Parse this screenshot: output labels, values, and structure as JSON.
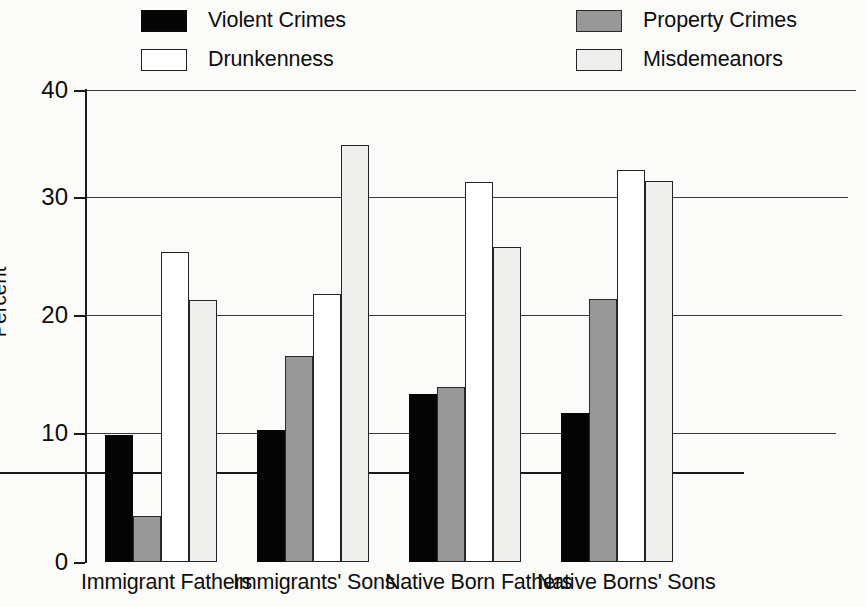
{
  "chart_data": {
    "type": "bar",
    "title": "",
    "subtitle": "",
    "xlabel": "",
    "ylabel": "Percent",
    "ylim": [
      0,
      40
    ],
    "yticks": [
      "0",
      "10",
      "20",
      "30",
      "40"
    ],
    "grid": true,
    "legend_position": "top",
    "categories": [
      "Immigrant Fathers",
      "Immigrants' Sons",
      "Native Born Fathers",
      "Native Borns' Sons"
    ],
    "series": [
      {
        "name": "Violent Crimes",
        "color": "#050505",
        "values": [
          10.8,
          11.2,
          14.2,
          12.6
        ]
      },
      {
        "name": "Property Crimes",
        "color": "#989898",
        "values": [
          3.9,
          17.5,
          14.8,
          22.3
        ]
      },
      {
        "name": "Drunkenness",
        "color": "#ffffff",
        "values": [
          26.3,
          22.7,
          32.2,
          33.2
        ]
      },
      {
        "name": "Misdemeanors",
        "color": "#efefed",
        "values": [
          22.2,
          35.3,
          26.7,
          32.3
        ]
      }
    ]
  },
  "legend": {
    "items": [
      {
        "label": "Violent Crimes",
        "swatch": "legend-swatch-violent-crimes"
      },
      {
        "label": "Property Crimes",
        "swatch": "legend-swatch-property-crimes"
      },
      {
        "label": "Drunkenness",
        "swatch": "legend-swatch-drunkenness"
      },
      {
        "label": "Misdemeanors",
        "swatch": "legend-swatch-misdemeanors"
      }
    ]
  },
  "axes": {
    "y_title": "Percent",
    "y_ticks": [
      "40",
      "30",
      "20",
      "10",
      "0"
    ]
  }
}
